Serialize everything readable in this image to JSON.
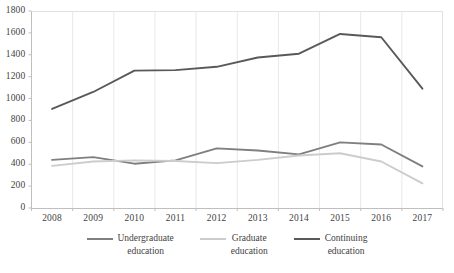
{
  "chart_data": {
    "type": "line",
    "title": "",
    "subtitle": "",
    "xlabel": "",
    "ylabel": "",
    "categories": [
      "2008",
      "2009",
      "2010",
      "2011",
      "2012",
      "2013",
      "2014",
      "2015",
      "2016",
      "2017"
    ],
    "ylim": [
      0,
      1800
    ],
    "ytick_labels": [
      "0",
      "200",
      "400",
      "600",
      "800",
      "1000",
      "1200",
      "1400",
      "1600",
      "1800"
    ],
    "ytick_values": [
      0,
      200,
      400,
      600,
      800,
      1000,
      1200,
      1400,
      1600,
      1800
    ],
    "grid": "vertical-only",
    "legend_position": "bottom",
    "series": [
      {
        "name": "Undergraduate education",
        "name_line1": "Undergraduate",
        "name_line2": "education",
        "color": "#7f7f7f",
        "values": [
          440,
          465,
          405,
          435,
          545,
          525,
          490,
          600,
          580,
          380
        ]
      },
      {
        "name": "Graduate education",
        "name_line1": "Graduate",
        "name_line2": "education",
        "color": "#cccccc",
        "values": [
          385,
          425,
          435,
          430,
          410,
          440,
          480,
          500,
          425,
          225
        ]
      },
      {
        "name": "Continuing education",
        "name_line1": "Continuing",
        "name_line2": "education",
        "color": "#595959",
        "values": [
          905,
          1060,
          1255,
          1260,
          1290,
          1375,
          1410,
          1590,
          1560,
          1090
        ]
      }
    ]
  },
  "axis": {
    "axis_color": "#bfbfbf",
    "gridline_color": "#e8e8e8",
    "tick_text_color": "#3f3f3f"
  }
}
